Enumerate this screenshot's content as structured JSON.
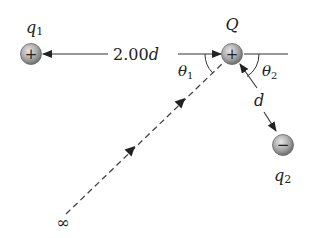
{
  "diagram": {
    "charges": {
      "q1": {
        "symbol": "q",
        "subscript": "1",
        "sign": "+"
      },
      "Q": {
        "symbol": "Q",
        "sign": "+"
      },
      "q2": {
        "symbol": "q",
        "subscript": "2",
        "sign": "−"
      }
    },
    "distance_label": {
      "value": "2.00",
      "unit": "d"
    },
    "d_label": "d",
    "angles": {
      "theta1": {
        "symbol": "θ",
        "subscript": "1"
      },
      "theta2": {
        "symbol": "θ",
        "subscript": "2"
      }
    },
    "infinity_label": "∞",
    "colors": {
      "line": "#333333",
      "charge_fill_light": "#d8d8d8",
      "charge_fill_dark": "#7a7a7a"
    }
  }
}
